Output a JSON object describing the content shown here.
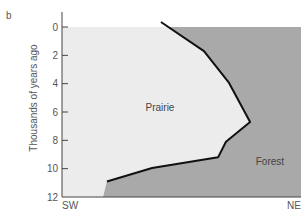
{
  "panel_label": "b",
  "chart_data": {
    "type": "area",
    "title": "",
    "xlabel": "",
    "ylabel": "Thousands of years ago",
    "x_axis": {
      "left_label": "SW",
      "right_label": "NE",
      "range": [
        0,
        1
      ]
    },
    "y_axis": {
      "ticks": [
        0,
        2,
        4,
        6,
        8,
        10,
        12
      ],
      "range": [
        0,
        12
      ],
      "inverted": true
    },
    "grid": false,
    "regions": [
      {
        "name": "Prairie",
        "color": "#ececec",
        "label_pos": {
          "x": 0.41,
          "y": 5.7
        }
      },
      {
        "name": "Forest",
        "color": "#a9a9a9",
        "label_pos": {
          "x": 0.87,
          "y": 9.5
        }
      }
    ],
    "boundary": {
      "description": "Prairie-forest boundary position over time (SW to NE)",
      "points": [
        {
          "x": 0.414,
          "y": -0.35
        },
        {
          "x": 0.594,
          "y": 1.7
        },
        {
          "x": 0.699,
          "y": 3.95
        },
        {
          "x": 0.787,
          "y": 6.7
        },
        {
          "x": 0.686,
          "y": 8.1
        },
        {
          "x": 0.653,
          "y": 9.2
        },
        {
          "x": 0.377,
          "y": 9.95
        },
        {
          "x": 0.188,
          "y": 10.9
        }
      ],
      "extension_unlined": [
        {
          "x": 0.188,
          "y": 10.9
        },
        {
          "x": 0.172,
          "y": 12
        }
      ],
      "line_color": "#111111"
    }
  }
}
